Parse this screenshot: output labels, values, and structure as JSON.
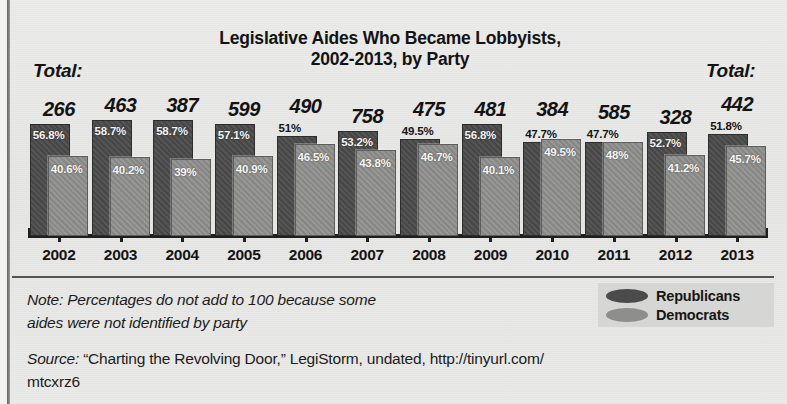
{
  "title": {
    "line1": "Legislative Aides Who Became Lobbyists,",
    "line2": "2002-2013, by Party"
  },
  "total_label_left": "Total:",
  "total_label_right": "Total:",
  "note": {
    "line1": "Note: Percentages do not add to 100 because some",
    "line2": "aides were not identified by party"
  },
  "legend": {
    "republicans": "Republicans",
    "democrats": "Democrats"
  },
  "source": {
    "word": "Source:",
    "line1": " “Charting the Revolving Door,” LegiStorm, undated, http://tinyurl.com/",
    "line2": "mtcxrz6"
  },
  "colors": {
    "republican": "#4b4b4b",
    "democrat": "#8e8e8c",
    "paper": "#e8e8e6",
    "ink": "#1b1b1b"
  },
  "chart_data": {
    "type": "bar",
    "title": "Legislative Aides Who Became Lobbyists, 2002-2013, by Party",
    "xlabel": "",
    "ylabel": "",
    "ylim": [
      0,
      60
    ],
    "grid": false,
    "legend_position": "bottom-right",
    "categories": [
      "2002",
      "2003",
      "2004",
      "2005",
      "2006",
      "2007",
      "2008",
      "2009",
      "2010",
      "2011",
      "2012",
      "2013"
    ],
    "totals": [
      266,
      463,
      387,
      599,
      490,
      758,
      475,
      481,
      384,
      585,
      328,
      442
    ],
    "series": [
      {
        "name": "Republicans",
        "values": [
          56.8,
          58.7,
          58.7,
          57.1,
          51,
          53.2,
          49.5,
          56.8,
          47.7,
          47.7,
          52.7,
          51.8
        ],
        "labels": [
          "56.8%",
          "58.7%",
          "58.7%",
          "57.1%",
          "51%",
          "53.2%",
          "49.5%",
          "56.8%",
          "47.7%",
          "47.7%",
          "52.7%",
          "51.8%"
        ],
        "label_outside": [
          false,
          false,
          false,
          false,
          true,
          false,
          true,
          false,
          true,
          true,
          false,
          true
        ],
        "color": "#4b4b4b"
      },
      {
        "name": "Democrats",
        "values": [
          40.6,
          40.2,
          39,
          40.9,
          46.5,
          43.8,
          46.7,
          40.1,
          49.5,
          48,
          41.2,
          45.7
        ],
        "labels": [
          "40.6%",
          "40.2%",
          "39%",
          "40.9%",
          "46.5%",
          "43.8%",
          "46.7%",
          "40.1%",
          "49.5%",
          "48%",
          "41.2%",
          "45.7%"
        ],
        "label_outside": [
          false,
          false,
          false,
          false,
          false,
          false,
          false,
          false,
          false,
          false,
          false,
          false
        ],
        "color": "#8e8e8c"
      }
    ],
    "totals_formatted": [
      "266",
      "463",
      "387",
      "599",
      "490",
      "758",
      "475",
      "481",
      "384",
      "585",
      "328",
      "442"
    ]
  }
}
